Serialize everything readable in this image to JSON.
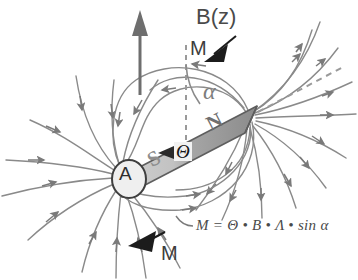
{
  "diagram": {
    "type": "physics-vector-diagram",
    "canvas": {
      "width": 358,
      "height": 280,
      "background": "#ffffff"
    }
  },
  "labels": {
    "external_field": "B(z)",
    "torque_top": "M",
    "torque_bottom": "M",
    "angle_alpha": "α",
    "angle_theta": "Θ",
    "pole_south": "S",
    "pole_north": "N",
    "pivot": "A",
    "formula": "M = Θ • B • Λ • sin α"
  },
  "magnet": {
    "south_end": [
      126,
      181
    ],
    "north_end": [
      249,
      117
    ],
    "tilt_degrees": -27,
    "body_color_light": "#c9c9c9",
    "body_color_dark": "#8f8f8f",
    "outline_color": "#5a5a5a",
    "pivot_circle_fill": "#ededed",
    "pivot_circle_stroke": "#4a4a4a",
    "pivot_center": [
      129,
      179
    ],
    "pivot_radius": 16
  },
  "vectors": {
    "b_field_arrow": {
      "name": "B(z)",
      "from": [
        140,
        95
      ],
      "to": [
        140,
        14
      ],
      "color": "#6e6e6e",
      "direction": "up"
    },
    "axis_dashed_vertical": {
      "from": [
        186,
        48
      ],
      "to": [
        186,
        152
      ],
      "color": "#8a8a8a",
      "style": "dashed"
    },
    "magnet_axis_extension": {
      "from": [
        253,
        114
      ],
      "to": [
        340,
        68
      ],
      "color": "#8a8a8a",
      "style": "dashed"
    },
    "torque_arrow_top": {
      "tip": [
        216,
        52
      ],
      "color": "#1c1c1c",
      "direction": "upper-right"
    },
    "torque_arrow_bottom": {
      "tip": [
        139,
        243
      ],
      "color": "#1c1c1c",
      "direction": "lower-left"
    },
    "alpha_arc": {
      "center": [
        249,
        117
      ],
      "color": "#8a8a8a",
      "between": [
        "B(z) axis",
        "magnet axis"
      ]
    }
  },
  "field_lines": {
    "color": "#8a8a8a",
    "arrow_color": "#7a7a7a",
    "stroke_width": 1.4,
    "description": "Dipole field lines emerging from N pole and converging into S pole",
    "north_radial_count": 11,
    "south_radial_count": 11,
    "loop_count": 6
  },
  "colors": {
    "background": "#ffffff",
    "ink": "#4a4a4a",
    "field_line": "#8a8a8a",
    "magnet_dark": "#8f8f8f",
    "magnet_light": "#c9c9c9",
    "arrow_black": "#1c1c1c"
  }
}
